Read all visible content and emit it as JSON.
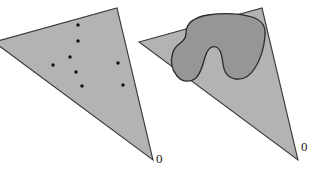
{
  "figure": {
    "background_color": "#ffffff",
    "cone_fill": "#b3b3b3",
    "cone_stroke": "#3a3a3a",
    "blob_fill": "#969696",
    "blob_stroke": "#2b2b2b",
    "point_color": "#111111"
  },
  "panels": [
    {
      "id": "left-panel",
      "name": "cone-with-points",
      "origin_label": "0",
      "cone_path": "M -6,42 L 117,8 L 153,160 Z",
      "points": [
        {
          "cx": 78,
          "cy": 25
        },
        {
          "cx": 78,
          "cy": 41
        },
        {
          "cx": 70,
          "cy": 57
        },
        {
          "cx": 53,
          "cy": 65
        },
        {
          "cx": 76,
          "cy": 72
        },
        {
          "cx": 118,
          "cy": 63
        },
        {
          "cx": 82,
          "cy": 86
        },
        {
          "cx": 123,
          "cy": 85
        }
      ],
      "point_radius": 1.7
    },
    {
      "id": "right-panel",
      "name": "cone-with-blob",
      "origin_label": "0",
      "cone_path": "M 139,42 L 262,8 L 298,160 Z",
      "blob_path": "M 186,33 C 186,22 196,17 208,15 C 222,13 238,13 252,17 C 262,20 266,27 265,36 C 264,48 260,60 255,68 C 250,76 244,80 236,79 C 228,78 224,72 223,64 C 222,56 221,49 216,47 C 211,45 207,50 205,57 C 203,65 201,73 196,78 C 190,83 182,82 177,76 C 172,70 170,61 173,52 C 176,43 186,43 186,33 Z"
    }
  ],
  "labels": {
    "left_zero": "0",
    "right_zero": "0"
  }
}
